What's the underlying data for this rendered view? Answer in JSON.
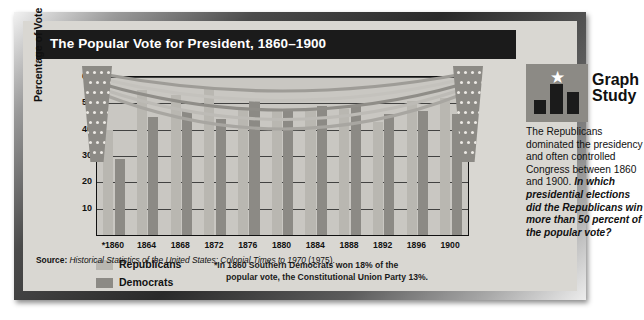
{
  "title": "The Popular Vote for President, 1860–1900",
  "axis": {
    "ylabel": "Percentage of Vote",
    "yticks": [
      10,
      20,
      30,
      40,
      50,
      60
    ]
  },
  "legend": [
    {
      "key": "republicans",
      "label": "Republicans",
      "color": "#b9b7b1"
    },
    {
      "key": "democrats",
      "label": "Democrats",
      "color": "#8c8a85"
    }
  ],
  "footnote": {
    "line1": "*In 1860 Southern Democrats won 18% of the",
    "line2": "popular vote, the Constitutional Union Party 13%."
  },
  "source": {
    "label": "Source:",
    "text": "Historical Statistics of the United States: Colonial Times to 1970",
    "year": "(1975)."
  },
  "sidebar": {
    "logo_title_line1": "Graph",
    "logo_title_line2": "Study",
    "body_intro": "The Republicans dominated the presidency and often controlled Congress between 1860 and 1900.",
    "body_question": "In which presidential elections did the Republicans win more than 50 percent of the popular vote?"
  },
  "chart_data": {
    "type": "bar",
    "title": "The Popular Vote for President, 1860–1900",
    "xlabel": "",
    "ylabel": "Percentage of Vote",
    "ylim": [
      0,
      60
    ],
    "grid": true,
    "legend_position": "below-left",
    "categories": [
      "*1860",
      "1864",
      "1868",
      "1872",
      "1876",
      "1880",
      "1884",
      "1888",
      "1892",
      "1896",
      "1900"
    ],
    "series": [
      {
        "name": "Republicans",
        "color": "#b9b7b1",
        "values": [
          40,
          55,
          53,
          56,
          48,
          48,
          48,
          48,
          43,
          51,
          52
        ]
      },
      {
        "name": "Democrats",
        "color": "#8c8a85",
        "values": [
          29,
          45,
          47,
          44,
          51,
          48,
          49,
          49,
          46,
          47,
          46
        ]
      }
    ]
  }
}
